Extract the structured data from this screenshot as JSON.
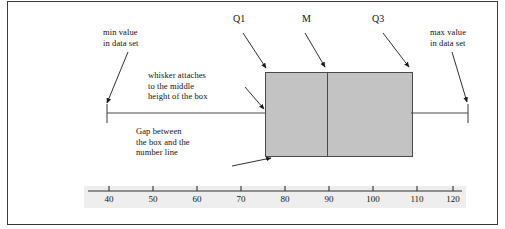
{
  "figure": {
    "type": "boxplot-annotated-diagram",
    "background_color": "#ffffff",
    "border_color": "#3b3b3b",
    "box_fill_color": "#c3c3c3",
    "line_color": "#4a4a4a"
  },
  "annotations": {
    "min_value": "min value\nin data set",
    "whisker_attaches": "whisker attaches\nto the middle\nheight of the box",
    "q1": "Q1",
    "median": "M",
    "q3": "Q3",
    "max_value": "max value\nin data set",
    "gap": "Gap between\nthe box and the\nnumber line"
  },
  "chart_data": {
    "type": "boxplot",
    "title": "",
    "xlabel": "",
    "ylabel": "",
    "orientation": "horizontal",
    "grid": false,
    "legend": "none",
    "xlim": [
      35,
      125
    ],
    "axis_ticks": [
      40,
      50,
      60,
      70,
      80,
      90,
      100,
      110,
      120
    ],
    "tick_labels": [
      "40",
      "50",
      "60",
      "70",
      "80",
      "90",
      "100",
      "110",
      "120"
    ],
    "series": [
      {
        "name": "box plot",
        "min": 40,
        "q1": 77,
        "median": 89,
        "q3": 105,
        "max": 119
      }
    ]
  }
}
